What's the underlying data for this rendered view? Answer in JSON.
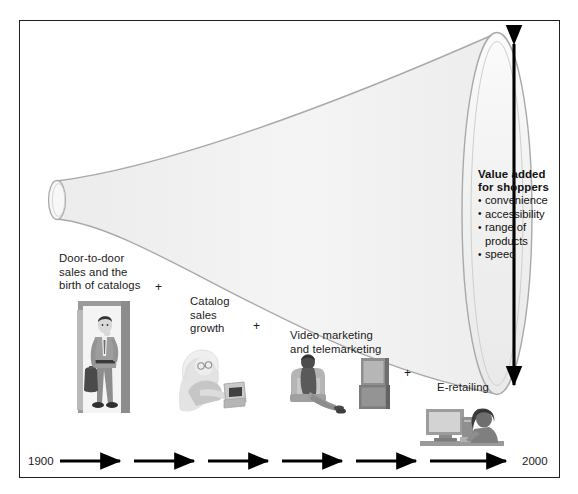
{
  "figure": {
    "title_present": false,
    "frame_color": "#231f20",
    "funnel_fill": "#f2f2f2",
    "funnel_stroke": "#a8a8a8",
    "background": "#ffffff"
  },
  "stages": [
    {
      "id": "door-to-door",
      "label": "Door-to-door\nsales and the\nbirth of catalogs",
      "illustration": "salesman-in-doorway-icon"
    },
    {
      "id": "catalog",
      "label": "Catalog\nsales\ngrowth",
      "illustration": "person-reading-catalog-icon"
    },
    {
      "id": "video-telemarketing",
      "label": "Video marketing\nand telemarketing",
      "illustration": "person-watching-tv-icon"
    },
    {
      "id": "e-retailing",
      "label": "E-retailing",
      "illustration": "person-at-computer-icon"
    }
  ],
  "connectors": {
    "plus_symbol": "+",
    "count": 3
  },
  "value_added": {
    "title": "Value added\nfor shoppers",
    "items": [
      "convenience",
      "accessibility",
      "range of\n products",
      "speed"
    ]
  },
  "timeline": {
    "start_year": "1900",
    "end_year": "2000",
    "arrow_segments": 6
  },
  "value_arrow": {
    "type": "double-headed-vertical-arrow",
    "color": "#000000"
  }
}
